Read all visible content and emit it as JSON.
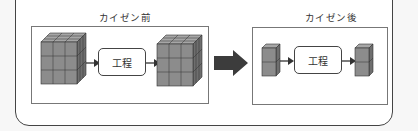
{
  "diagram": {
    "before": {
      "title": "カイゼン前",
      "process_label": "工程",
      "input_batch": "3x3x3 cubes",
      "output_batch": "3x3x3 cubes"
    },
    "after": {
      "title": "カイゼン後",
      "process_label": "工程",
      "input_batch": "1x2 cubes",
      "output_batch": "1x2 cubes"
    },
    "transition_arrow": "right-arrow",
    "colors": {
      "cube_front": "#8c8c8c",
      "cube_top": "#a6a6a6",
      "cube_side": "#6e6e6e",
      "cube_line": "#333333",
      "arrow_big": "#3c3c3c",
      "frame": "#444444",
      "panel_border": "#777777"
    }
  }
}
